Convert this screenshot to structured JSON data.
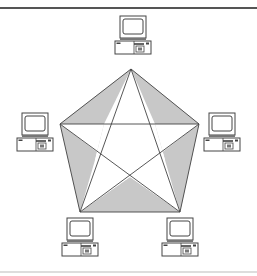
{
  "diagram": {
    "topology": "full-mesh",
    "colors": {
      "background": "#ffffff",
      "top_rule": "#555555",
      "bottom_rule": "#bbbbbb",
      "line": "#444444",
      "fill": "#c8c8c8",
      "computer_stroke": "#444444",
      "computer_fill": "#ffffff"
    },
    "nodes": [
      {
        "id": "top",
        "label": "computer-top",
        "vertex": [
          131,
          69
        ],
        "icon": [
          115,
          16
        ]
      },
      {
        "id": "left",
        "label": "computer-left",
        "vertex": [
          60,
          124
        ],
        "icon": [
          17,
          113
        ]
      },
      {
        "id": "right",
        "label": "computer-right",
        "vertex": [
          199,
          124
        ],
        "icon": [
          204,
          113
        ]
      },
      {
        "id": "bottom-left",
        "label": "computer-bottom-left",
        "vertex": [
          80,
          212
        ],
        "icon": [
          62,
          218
        ]
      },
      {
        "id": "bottom-right",
        "label": "computer-bottom-right",
        "vertex": [
          180,
          212
        ],
        "icon": [
          162,
          218
        ]
      }
    ],
    "edges_count": 10
  }
}
